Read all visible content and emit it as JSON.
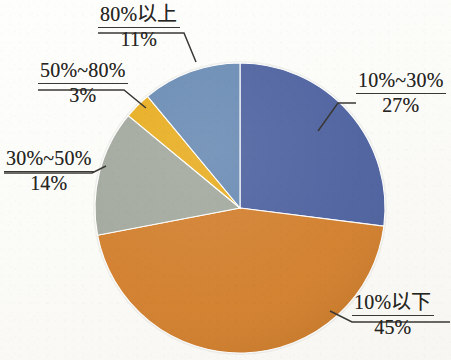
{
  "chart_data": {
    "type": "pie",
    "title": "",
    "subtitle": "",
    "xlabel": "",
    "ylabel": "",
    "legend_position": "none",
    "grid": false,
    "labels_show_percent": true,
    "start_angle_deg": 0,
    "direction": "clockwise",
    "categories": [
      "10%~30%",
      "10%以下",
      "30%~50%",
      "50%~80%",
      "80%以上"
    ],
    "values": [
      27,
      45,
      14,
      3,
      11
    ],
    "value_labels": [
      "27%",
      "45%",
      "14%",
      "3%",
      "11%"
    ],
    "colors": [
      "#4F63A0",
      "#D2802E",
      "#A3A99E",
      "#E8AE22",
      "#6B8CB4"
    ],
    "slices": [
      {
        "label": "10%~30%",
        "value": 27,
        "value_label": "27%",
        "color": "#4F63A0"
      },
      {
        "label": "10%以下",
        "value": 45,
        "value_label": "45%",
        "color": "#D2802E"
      },
      {
        "label": "30%~50%",
        "value": 14,
        "value_label": "14%",
        "color": "#A3A99E"
      },
      {
        "label": "50%~80%",
        "value": 3,
        "value_label": "3%",
        "color": "#E8AE22"
      },
      {
        "label": "80%以上",
        "value": 11,
        "value_label": "11%",
        "color": "#6B8CB4"
      }
    ]
  },
  "figure": {
    "background_color": "#fdfdfb",
    "text_color": "#262521",
    "leader_line_color": "#3a3834"
  }
}
